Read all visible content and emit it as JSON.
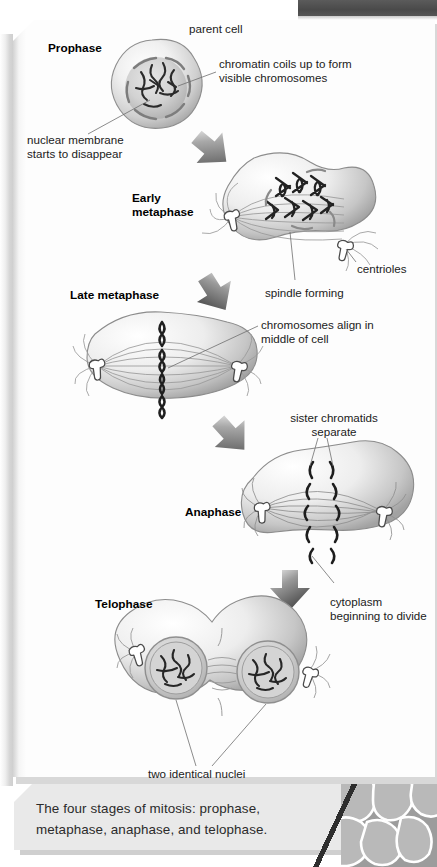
{
  "figure": {
    "caption": "The four stages of mitosis: prophase, metaphase, anaphase, and telophase."
  },
  "stages": [
    {
      "id": "prophase",
      "label": "Prophase"
    },
    {
      "id": "early-metaphase",
      "label": "Early\nmetaphase"
    },
    {
      "id": "late-metaphase",
      "label": "Late metaphase"
    },
    {
      "id": "anaphase",
      "label": "Anaphase"
    },
    {
      "id": "telophase",
      "label": "Telophase"
    }
  ],
  "annotations": [
    {
      "id": "parent-cell",
      "text": "parent cell"
    },
    {
      "id": "chromatin",
      "text": "chromatin coils up to form\nvisible chromosomes"
    },
    {
      "id": "nuclear-membrane",
      "text": "nuclear membrane\nstarts to disappear"
    },
    {
      "id": "centrioles",
      "text": "centrioles"
    },
    {
      "id": "spindle",
      "text": "spindle forming"
    },
    {
      "id": "chromosomes-align",
      "text": "chromosomes align in\nmiddle of cell"
    },
    {
      "id": "sister-chromatids",
      "text": "sister chromatids\nseparate"
    },
    {
      "id": "cytoplasm",
      "text": "cytoplasm\nbeginning to divide"
    },
    {
      "id": "two-nuclei",
      "text": "two identical nuclei"
    }
  ],
  "colors": {
    "page": "#fdfdfd",
    "caption_bg": "#e9e9e9",
    "ink": "#1b1b1b",
    "cell_light": "#f4f4f4",
    "cell_mid": "#c8c8c8",
    "cell_dark": "#9b9b9b",
    "arrow_dark": "#5a5a5a",
    "top_band": "#4f4f4f"
  }
}
